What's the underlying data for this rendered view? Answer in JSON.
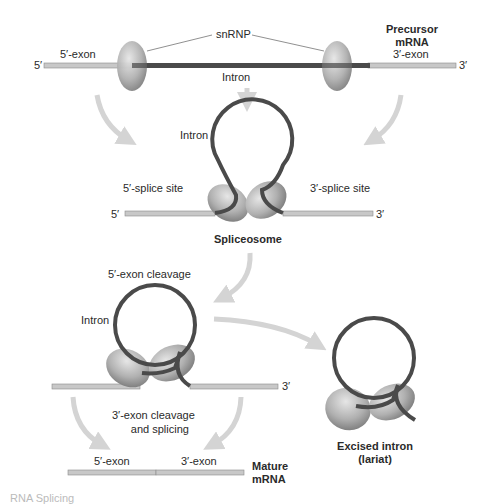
{
  "title": "RNA Splicing",
  "colors": {
    "exon": "#c8c8c8",
    "exon_border": "#8a8a8a",
    "intron": "#4a4a4a",
    "snrnp": "#b3b3b3",
    "arrow": "#d4d4d4",
    "text": "#2a2a2a"
  },
  "stage1": {
    "title": "Precursor\nmRNA",
    "title_line1": "Precursor",
    "title_line2": "mRNA",
    "five_prime": "5′",
    "three_prime": "3′",
    "exon5_label": "5′-exon",
    "exon3_label": "3′-exon",
    "snrnp_label": "snRNP",
    "intron_label": "Intron"
  },
  "stage2": {
    "intron_label": "Intron",
    "splice5_label": "5′-splice site",
    "splice3_label": "3′-splice site",
    "five_prime": "5′",
    "three_prime": "3′",
    "title": "Spliceosome"
  },
  "stage3": {
    "step_label": "5′-exon cleavage",
    "intron_label": "Intron",
    "three_prime": "3′"
  },
  "stage4": {
    "step_label_line1": "3′-exon cleavage",
    "step_label_line2": "and splicing",
    "exon5_label": "5′-exon",
    "exon3_label": "3′-exon",
    "title_line1": "Mature",
    "title_line2": "mRNA"
  },
  "lariat": {
    "title_line1": "Excised intron",
    "title_line2": "(lariat)"
  },
  "caption": "RNA Splicing"
}
